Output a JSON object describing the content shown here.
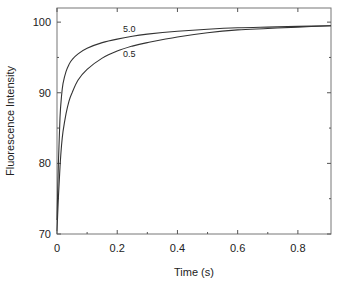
{
  "chart_data": {
    "type": "line",
    "title": "",
    "xlabel": "Time (s)",
    "ylabel": "Fluorescence Intensity",
    "xlim": [
      0,
      0.91
    ],
    "ylim": [
      70,
      102
    ],
    "grid": false,
    "legend": "none (inline curve labels)",
    "x_ticks": [
      0,
      0.2,
      0.4,
      0.6,
      0.8
    ],
    "x_tick_labels": [
      "0",
      "0.2",
      "0.4",
      "0.6",
      "0.8"
    ],
    "x_minor_ticks": [
      0.1,
      0.3,
      0.5,
      0.7
    ],
    "y_ticks": [
      70,
      80,
      90,
      100
    ],
    "y_tick_labels": [
      "70",
      "80",
      "90",
      "100"
    ],
    "y_minor_ticks": [
      75,
      85,
      95
    ],
    "series": [
      {
        "name": "5.0",
        "label_pos": {
          "x": 0.24,
          "y": 98.6
        },
        "x": [
          0,
          0.005,
          0.01,
          0.015,
          0.02,
          0.03,
          0.04,
          0.05,
          0.07,
          0.1,
          0.15,
          0.2,
          0.25,
          0.3,
          0.4,
          0.5,
          0.6,
          0.7,
          0.8,
          0.91
        ],
        "values": [
          72.0,
          80.5,
          86.5,
          89.5,
          91.3,
          93.0,
          94.0,
          94.7,
          95.5,
          96.3,
          97.1,
          97.6,
          98.0,
          98.3,
          98.7,
          99.0,
          99.2,
          99.3,
          99.4,
          99.5
        ]
      },
      {
        "name": "0.5",
        "label_pos": {
          "x": 0.24,
          "y": 95.0
        },
        "x": [
          0,
          0.005,
          0.01,
          0.015,
          0.02,
          0.03,
          0.04,
          0.05,
          0.07,
          0.1,
          0.15,
          0.2,
          0.25,
          0.3,
          0.4,
          0.5,
          0.6,
          0.7,
          0.8,
          0.91
        ],
        "values": [
          70.5,
          75.5,
          79.5,
          82.5,
          84.5,
          87.0,
          88.8,
          90.0,
          91.8,
          93.3,
          94.9,
          95.9,
          96.6,
          97.1,
          97.9,
          98.5,
          98.9,
          99.1,
          99.3,
          99.5
        ]
      }
    ]
  },
  "axes": {
    "xlabel": "Time (s)",
    "ylabel": "Fluorescence Intensity"
  }
}
